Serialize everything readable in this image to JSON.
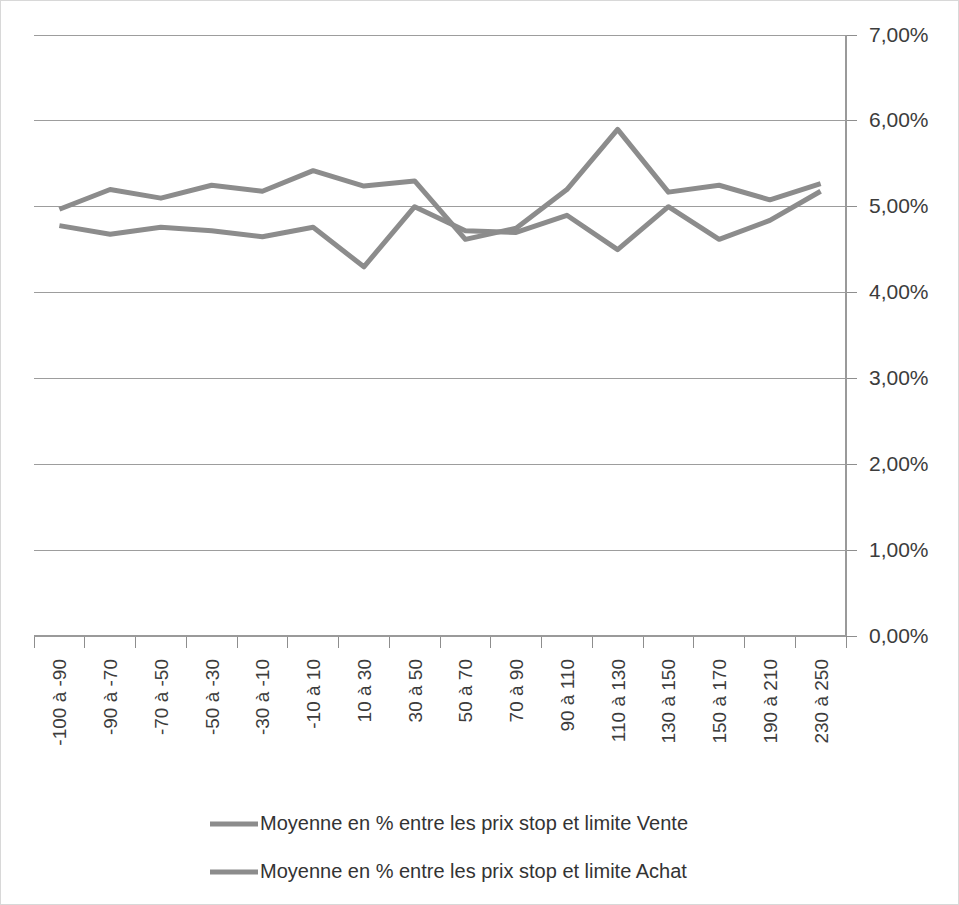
{
  "chart_data": {
    "type": "line",
    "title": "",
    "xlabel": "",
    "ylabel": "",
    "ylim": [
      0,
      7
    ],
    "y_tick_step": 1,
    "y_tick_labels": [
      "0,00%",
      "1,00%",
      "2,00%",
      "3,00%",
      "4,00%",
      "5,00%",
      "6,00%",
      "7,00%"
    ],
    "grid": true,
    "legend_position": "bottom",
    "categories": [
      "-100 à -90",
      "-90 à -70",
      "-70 à -50",
      "-50 à -30",
      "-30 à -10",
      "-10 à 10",
      "10 à 30",
      "30 à 50",
      "50 à 70",
      "70 à 90",
      "90 à 110",
      "110 à 130",
      "130 à 150",
      "150 à 170",
      "190 à 210",
      "230 à 250"
    ],
    "series": [
      {
        "name": "Moyenne en % entre les prix stop et limite Vente",
        "color": "#8c8c8c",
        "values": [
          4.97,
          5.2,
          5.1,
          5.25,
          5.18,
          5.42,
          5.24,
          5.3,
          4.62,
          4.75,
          5.2,
          5.9,
          5.17,
          5.25,
          5.08,
          5.27
        ]
      },
      {
        "name": "Moyenne en % entre les prix stop et limite Achat",
        "color": "#8c8c8c",
        "values": [
          4.78,
          4.68,
          4.76,
          4.72,
          4.65,
          4.76,
          4.3,
          5.0,
          4.72,
          4.7,
          4.9,
          4.5,
          5.0,
          4.62,
          4.84,
          5.18
        ]
      }
    ]
  },
  "legend": {
    "items": [
      {
        "label": "Moyenne en % entre les prix stop et limite Vente",
        "color": "#8c8c8c"
      },
      {
        "label": "Moyenne en % entre les prix stop et limite Achat",
        "color": "#8c8c8c"
      }
    ]
  }
}
